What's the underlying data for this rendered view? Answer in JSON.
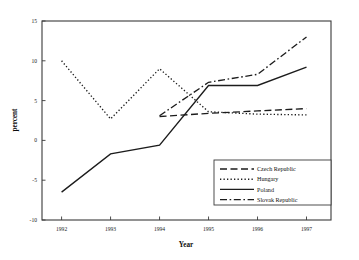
{
  "chart_data": {
    "type": "line",
    "title": "",
    "xlabel": "Year",
    "ylabel": "percent",
    "x": [
      1992,
      1993,
      1994,
      1995,
      1996,
      1997
    ],
    "xticklabels": [
      "1992",
      "1993",
      "1994",
      "1995",
      "1996",
      "1997"
    ],
    "xlim": [
      1991.6,
      1997.5
    ],
    "ylim": [
      -10,
      15
    ],
    "yticks": [
      -10,
      -5,
      0,
      5,
      10,
      15
    ],
    "yticklabels": [
      "-10",
      "-5",
      "0",
      "5",
      "10",
      "15"
    ],
    "grid": false,
    "legend_position": "lower right",
    "series": [
      {
        "name": "Czech Republic",
        "dash": "dashed",
        "x": [
          1994,
          1995,
          1996,
          1997
        ],
        "values": [
          3.0,
          3.4,
          3.7,
          4.0
        ]
      },
      {
        "name": "Hungary",
        "dash": "dotted",
        "x": [
          1992,
          1993,
          1994,
          1995,
          1996,
          1997
        ],
        "values": [
          10.0,
          2.7,
          9.0,
          3.6,
          3.3,
          3.2
        ]
      },
      {
        "name": "Poland",
        "dash": "solid",
        "x": [
          1992,
          1993,
          1994,
          1995,
          1996,
          1997
        ],
        "values": [
          -6.5,
          -1.7,
          -0.6,
          6.9,
          6.9,
          9.2
        ]
      },
      {
        "name": "Slovak Republic",
        "dash": "dashdot",
        "x": [
          1994,
          1995,
          1996,
          1997
        ],
        "values": [
          3.1,
          7.3,
          8.3,
          13.0
        ]
      }
    ]
  },
  "legend": {
    "items": [
      {
        "label": "Czech Republic"
      },
      {
        "label": "Hungary"
      },
      {
        "label": "Poland"
      },
      {
        "label": "Slovak Republic"
      }
    ]
  },
  "axis": {
    "x_title": "Year",
    "y_title": "percent"
  }
}
